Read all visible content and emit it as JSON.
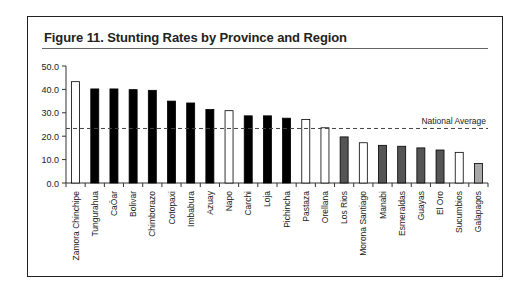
{
  "figure": {
    "title": "Figure 11.  Stunting Rates by Province and Region"
  },
  "chart_data": {
    "type": "bar",
    "title": "Figure 11.  Stunting Rates by Province and Region",
    "xlabel": "",
    "ylabel": "",
    "ylim": [
      0,
      50
    ],
    "yticks": [
      "0.0",
      "10.0",
      "20.0",
      "30.0",
      "40.0",
      "50.0"
    ],
    "grid": false,
    "categories": [
      "Zamora Chinchipe",
      "Tungurahua",
      "CaÖar",
      "Bolivar",
      "Chimborazo",
      "Cotopaxi",
      "Imbabura",
      "Azuay",
      "Napo",
      "Carchi",
      "Loja",
      "Pichincha",
      "Pastaza",
      "Orellana",
      "Los Rios",
      "Morona Santiago",
      "Manabi",
      "Esmeraldas",
      "Guayas",
      "El Oro",
      "Sucumbios",
      "Galapagos"
    ],
    "values": [
      43.3,
      40.2,
      40.2,
      39.9,
      39.6,
      35.0,
      34.2,
      31.4,
      30.9,
      28.7,
      28.7,
      27.7,
      27.1,
      23.6,
      19.7,
      17.2,
      16.1,
      15.7,
      15.0,
      14.1,
      13.1,
      8.3
    ],
    "bar_styles": [
      "white",
      "black",
      "black",
      "black",
      "black",
      "black",
      "black",
      "black",
      "white",
      "black",
      "black",
      "black",
      "white",
      "white",
      "darkgray",
      "white",
      "darkgray",
      "darkgray",
      "darkgray",
      "darkgray",
      "white",
      "lightgray"
    ],
    "colors": {
      "black": "#000000",
      "white": "#ffffff",
      "darkgray": "#555555",
      "lightgray": "#a8a8a8",
      "outline": "#000000"
    },
    "reference_line": {
      "label": "National Average",
      "value": 23.3,
      "style": "dashed"
    }
  }
}
